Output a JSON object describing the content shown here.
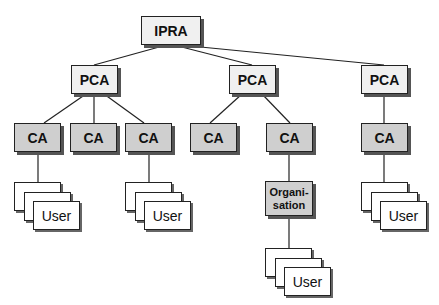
{
  "diagram": {
    "type": "hierarchy-tree",
    "root": {
      "label": "IPRA"
    },
    "pcas": [
      {
        "label": "PCA"
      },
      {
        "label": "PCA"
      },
      {
        "label": "PCA"
      }
    ],
    "cas": [
      {
        "label": "CA",
        "parent": 0
      },
      {
        "label": "CA",
        "parent": 0
      },
      {
        "label": "CA",
        "parent": 0
      },
      {
        "label": "CA",
        "parent": 1
      },
      {
        "label": "CA",
        "parent": 1
      },
      {
        "label": "CA",
        "parent": 2
      }
    ],
    "organisation": {
      "label_line1": "Organi-",
      "label_line2": "sation",
      "parent_ca": 4
    },
    "user_groups": [
      {
        "label": "User",
        "parent": "CA 1"
      },
      {
        "label": "User",
        "parent": "CA 3"
      },
      {
        "label": "User",
        "parent": "Organisation"
      },
      {
        "label": "User",
        "parent": "CA 6"
      }
    ]
  },
  "colors": {
    "top_box_fill": "#f0f0f0",
    "ca_box_fill": "#cfcfcf",
    "line": "#222222",
    "shadow": "#555555"
  }
}
